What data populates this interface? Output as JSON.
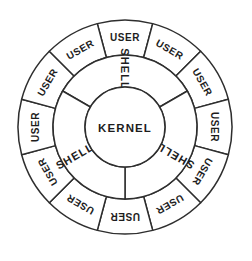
{
  "diagram": {
    "background_color": "#ffffff",
    "line_color": "#2e2e2e",
    "text_color": "#1d1d1d",
    "geometry": {
      "center_x": 125,
      "center_y": 127,
      "outer_radius": 107,
      "user_inner_radius": 72,
      "shell_inner_radius": 40
    },
    "core": {
      "label": "KERNEL"
    },
    "shell_ring": {
      "label": "SHELL",
      "segment_count": 3,
      "segments": [
        {
          "label": "SHELL",
          "center_angle_deg": 270,
          "start_angle_deg": 210,
          "end_angle_deg": 330
        },
        {
          "label": "SHELL",
          "center_angle_deg": 30,
          "start_angle_deg": 330,
          "end_angle_deg": 90
        },
        {
          "label": "SHELL",
          "center_angle_deg": 150,
          "start_angle_deg": 90,
          "end_angle_deg": 210
        }
      ]
    },
    "user_ring": {
      "label": "USER",
      "segment_count": 12,
      "segment_span_deg": 30,
      "segments": [
        {
          "label": "USER",
          "center_angle_deg": 270
        },
        {
          "label": "USER",
          "center_angle_deg": 300
        },
        {
          "label": "USER",
          "center_angle_deg": 330
        },
        {
          "label": "USER",
          "center_angle_deg": 0
        },
        {
          "label": "USER",
          "center_angle_deg": 30
        },
        {
          "label": "USER",
          "center_angle_deg": 60
        },
        {
          "label": "USER",
          "center_angle_deg": 90
        },
        {
          "label": "USER",
          "center_angle_deg": 120
        },
        {
          "label": "USER",
          "center_angle_deg": 150
        },
        {
          "label": "USER",
          "center_angle_deg": 180
        },
        {
          "label": "USER",
          "center_angle_deg": 210
        },
        {
          "label": "USER",
          "center_angle_deg": 240
        }
      ]
    }
  }
}
